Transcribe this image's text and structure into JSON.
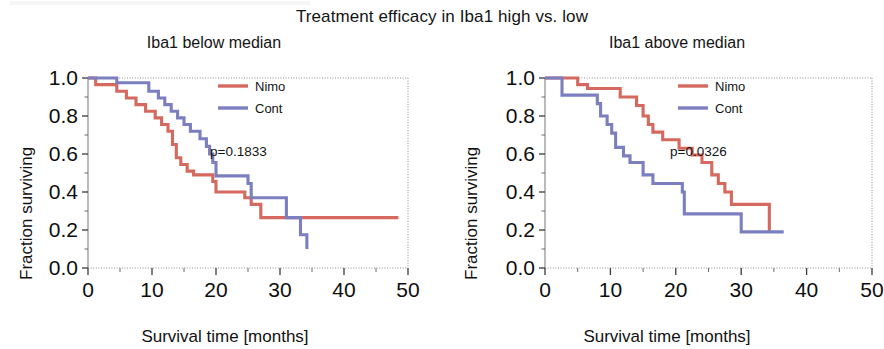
{
  "figure": {
    "title": "Treatment efficacy in Iba1 high vs. low"
  },
  "colors": {
    "nimo": "#d5695f",
    "cont": "#7b7fc0",
    "axis": "#8d8d8d",
    "text": "#141414",
    "background": "#ffffff"
  },
  "panels": [
    {
      "id": "left",
      "title": "Iba1 below median",
      "pvalue_label": "p=0.1833",
      "legend": [
        {
          "label": "Nimo",
          "color": "#d5695f"
        },
        {
          "label": "Cont",
          "color": "#7b7fc0"
        }
      ]
    },
    {
      "id": "right",
      "title": "Iba1 above median",
      "pvalue_label": "p=0.0326",
      "legend": [
        {
          "label": "Nimo",
          "color": "#d5695f"
        },
        {
          "label": "Cont",
          "color": "#7b7fc0"
        }
      ]
    }
  ],
  "axes": {
    "x": {
      "label": "Survival time [months]",
      "ticks": [
        0,
        10,
        20,
        30,
        40,
        50
      ],
      "tick_labels": [
        "0",
        "10",
        "20",
        "30",
        "40",
        "50"
      ],
      "minor_step": 5,
      "range": [
        0,
        50
      ]
    },
    "y": {
      "label": "Fraction surviving",
      "ticks": [
        0.0,
        0.2,
        0.4,
        0.6,
        0.8,
        1.0
      ],
      "tick_labels": [
        "0.0",
        "0.2",
        "0.4",
        "0.6",
        "0.8",
        "1.0"
      ],
      "minor_step": 0.1,
      "range": [
        0.0,
        1.0
      ]
    }
  },
  "chart_data": [
    {
      "type": "line",
      "subtype": "kaplan-meier-step",
      "title": "Iba1 below median",
      "xlabel": "Survival time [months]",
      "ylabel": "Fraction surviving",
      "xlim": [
        0,
        50
      ],
      "ylim": [
        0,
        1
      ],
      "grid": false,
      "legend_position": "top-right",
      "annotations": [
        {
          "text": "p=0.1833",
          "x": 30.5,
          "y": 0.6
        }
      ],
      "series": [
        {
          "name": "Nimo",
          "color": "#d5695f",
          "points": [
            [
              0,
              1.0
            ],
            [
              1.2,
              0.965
            ],
            [
              4.5,
              0.93
            ],
            [
              6.0,
              0.895
            ],
            [
              7.5,
              0.86
            ],
            [
              9.0,
              0.825
            ],
            [
              10.5,
              0.79
            ],
            [
              11.5,
              0.755
            ],
            [
              12.5,
              0.72
            ],
            [
              13.2,
              0.65
            ],
            [
              13.8,
              0.58
            ],
            [
              14.5,
              0.545
            ],
            [
              15.5,
              0.51
            ],
            [
              16.5,
              0.49
            ],
            [
              19.5,
              0.455
            ],
            [
              20.0,
              0.4
            ],
            [
              24.5,
              0.37
            ],
            [
              25.5,
              0.335
            ],
            [
              27.0,
              0.265
            ],
            [
              48.5,
              0.265
            ]
          ]
        },
        {
          "name": "Cont",
          "color": "#7b7fc0",
          "points": [
            [
              0,
              1.0
            ],
            [
              4.5,
              0.975
            ],
            [
              9.0,
              0.975
            ],
            [
              9.5,
              0.93
            ],
            [
              11.0,
              0.895
            ],
            [
              12.0,
              0.86
            ],
            [
              13.0,
              0.825
            ],
            [
              14.0,
              0.79
            ],
            [
              15.0,
              0.755
            ],
            [
              16.0,
              0.72
            ],
            [
              17.5,
              0.68
            ],
            [
              18.5,
              0.64
            ],
            [
              19.0,
              0.6
            ],
            [
              19.5,
              0.555
            ],
            [
              20.0,
              0.485
            ],
            [
              24.5,
              0.485
            ],
            [
              25.0,
              0.445
            ],
            [
              25.5,
              0.37
            ],
            [
              30.5,
              0.37
            ],
            [
              31.0,
              0.265
            ],
            [
              32.8,
              0.265
            ],
            [
              33.2,
              0.175
            ],
            [
              34.0,
              0.175
            ],
            [
              34.2,
              0.1
            ]
          ]
        }
      ]
    },
    {
      "type": "line",
      "subtype": "kaplan-meier-step",
      "title": "Iba1 above median",
      "xlabel": "Survival time [months]",
      "ylabel": "Fraction surviving",
      "xlim": [
        0,
        50
      ],
      "ylim": [
        0,
        1
      ],
      "grid": false,
      "legend_position": "top-right",
      "annotations": [
        {
          "text": "p=0.0326",
          "x": 30.5,
          "y": 0.6
        }
      ],
      "series": [
        {
          "name": "Nimo",
          "color": "#d5695f",
          "points": [
            [
              0,
              1.0
            ],
            [
              4.5,
              1.0
            ],
            [
              5.0,
              0.965
            ],
            [
              6.5,
              0.945
            ],
            [
              11.0,
              0.945
            ],
            [
              11.5,
              0.9
            ],
            [
              13.5,
              0.9
            ],
            [
              14.0,
              0.855
            ],
            [
              15.0,
              0.8
            ],
            [
              15.8,
              0.755
            ],
            [
              16.5,
              0.715
            ],
            [
              18.0,
              0.675
            ],
            [
              20.0,
              0.675
            ],
            [
              20.5,
              0.63
            ],
            [
              22.5,
              0.595
            ],
            [
              24.0,
              0.555
            ],
            [
              25.0,
              0.555
            ],
            [
              25.5,
              0.49
            ],
            [
              26.5,
              0.445
            ],
            [
              27.5,
              0.4
            ],
            [
              28.5,
              0.335
            ],
            [
              34.0,
              0.335
            ],
            [
              34.3,
              0.19
            ]
          ]
        },
        {
          "name": "Cont",
          "color": "#7b7fc0",
          "points": [
            [
              0,
              1.0
            ],
            [
              2.3,
              1.0
            ],
            [
              2.6,
              0.91
            ],
            [
              7.5,
              0.91
            ],
            [
              8.0,
              0.865
            ],
            [
              8.5,
              0.8
            ],
            [
              9.5,
              0.755
            ],
            [
              10.2,
              0.71
            ],
            [
              10.8,
              0.635
            ],
            [
              12.0,
              0.59
            ],
            [
              13.0,
              0.555
            ],
            [
              14.5,
              0.555
            ],
            [
              15.0,
              0.49
            ],
            [
              16.5,
              0.445
            ],
            [
              20.5,
              0.445
            ],
            [
              21.0,
              0.4
            ],
            [
              21.3,
              0.285
            ],
            [
              29.5,
              0.285
            ],
            [
              30.0,
              0.19
            ],
            [
              36.5,
              0.19
            ]
          ]
        }
      ]
    }
  ]
}
